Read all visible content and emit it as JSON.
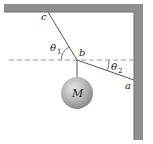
{
  "diagram": {
    "labels": {
      "point_c": "c",
      "point_b": "b",
      "point_a": "a",
      "mass": "M",
      "theta1": "θ",
      "theta1_sub": "1",
      "theta2": "θ",
      "theta2_sub": "2"
    },
    "colors": {
      "wall": "#8f8f8f",
      "wall_edge": "#6a6a6a",
      "string": "#555555",
      "dashed": "#9a9a9a",
      "ball_light": "#d9d9d9",
      "ball_dark": "#8a8a8a"
    }
  }
}
